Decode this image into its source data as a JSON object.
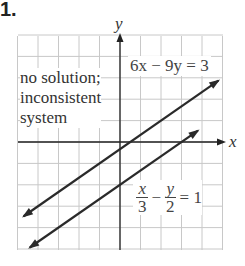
{
  "problem_number": "1.",
  "chart_data": {
    "type": "line",
    "title": "",
    "xlabel": "x",
    "ylabel": "y",
    "xlim": [
      -5,
      5
    ],
    "ylim": [
      -5,
      5
    ],
    "grid": true,
    "series": [
      {
        "name": "6x − 9y = 3",
        "slope": 0.6667,
        "intercept": -0.3333,
        "x": [
          -4.7,
          4.8
        ],
        "y": [
          -3.47,
          2.87
        ]
      },
      {
        "name": "x/3 − y/2 = 1",
        "slope": 0.6667,
        "intercept": -2,
        "x": [
          -4.4,
          3.8
        ],
        "y": [
          -4.93,
          0.53
        ]
      }
    ],
    "annotations": [
      "no solution; inconsistent system",
      "6x − 9y = 3",
      "x/3 − y/2 = 1"
    ]
  },
  "labels": {
    "axis_x": "x",
    "axis_y": "y",
    "note_line1": "no solution;",
    "note_line2": "inconsistent",
    "note_line3": "system",
    "eq1": "6x − 9y = 3",
    "eq2_num1": "x",
    "eq2_den1": "3",
    "eq2_minus": "−",
    "eq2_num2": "y",
    "eq2_den2": "2",
    "eq2_rhs": "= 1"
  },
  "colors": {
    "grid": "#c8c8c8",
    "axis": "#222222",
    "line": "#2a2a2a",
    "text": "#333333"
  }
}
